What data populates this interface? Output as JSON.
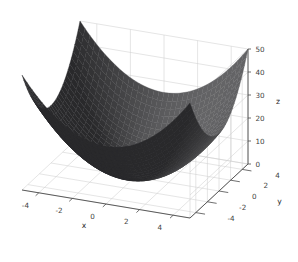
{
  "figure": {
    "background_color": "#ffffff",
    "width": 298,
    "height": 262,
    "plot_kind": "3d-surface"
  },
  "chart_data": {
    "type": "surface",
    "title": "",
    "subtitle": "",
    "xlabel": "x",
    "ylabel": "y",
    "zlabel": "z",
    "function": "z = x^2 + y^2",
    "xlim": [
      -5,
      5
    ],
    "ylim": [
      -5,
      5
    ],
    "zlim": [
      0,
      50
    ],
    "xticks": [
      -4,
      -2,
      0,
      2,
      4
    ],
    "yticks": [
      -4,
      -2,
      0,
      2,
      4
    ],
    "zticks": [
      0,
      10,
      20,
      30,
      40,
      50
    ],
    "xtick_labels": [
      "-4",
      "-2",
      "0",
      "2",
      "4"
    ],
    "ytick_labels": [
      "-4",
      "-2",
      "0",
      "2",
      "4"
    ],
    "ztick_labels": [
      "0",
      "10",
      "20",
      "30",
      "40",
      "50"
    ],
    "grid": true,
    "legend": null,
    "surface_color": "#2c2c2c",
    "surface_edge_color": "#1a1a1a",
    "grid_color": "#d0d0d0",
    "pane_color": "#ffffff",
    "axis_line_color": "#4a4a4a",
    "view": {
      "elevation": 26,
      "azimuth": -60
    },
    "x": [
      -5,
      -4.5,
      -4,
      -3.5,
      -3,
      -2.5,
      -2,
      -1.5,
      -1,
      -0.5,
      0,
      0.5,
      1,
      1.5,
      2,
      2.5,
      3,
      3.5,
      4,
      4.5,
      5
    ],
    "y": [
      -5,
      -4.5,
      -4,
      -3.5,
      -3,
      -2.5,
      -2,
      -1.5,
      -1,
      -0.5,
      0,
      0.5,
      1,
      1.5,
      2,
      2.5,
      3,
      3.5,
      4,
      4.5,
      5
    ],
    "z_corner_values": {
      "x=-5,y=-5": 50,
      "x=-5,y=5": 50,
      "x=5,y=-5": 50,
      "x=5,y=5": 50,
      "x=0,y=0": 0
    },
    "z_min_point": {
      "x": 0,
      "y": 0,
      "z": 0
    },
    "z_max_value": 50
  },
  "labels": {
    "x_axis": "x",
    "y_axis": "y",
    "z_axis": "z"
  }
}
